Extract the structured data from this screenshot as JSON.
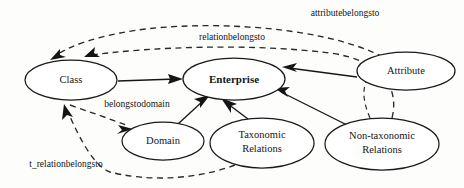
{
  "diagram": {
    "type": "ontology-concept-graph",
    "background_color": "#fdfdfc",
    "stroke_color": "#161616",
    "nodes": [
      {
        "id": "class",
        "label": "Class",
        "label_line1": "Class",
        "label_line2": "",
        "cx": 71,
        "cy": 80,
        "rx": 46,
        "ry": 20,
        "bold": false
      },
      {
        "id": "enterprise",
        "label": "Enterprise",
        "label_line1": "Enterprise",
        "label_line2": "",
        "cx": 234,
        "cy": 79,
        "rx": 51,
        "ry": 21,
        "bold": true
      },
      {
        "id": "attribute",
        "label": "Attribute",
        "label_line1": "Attribute",
        "label_line2": "",
        "cx": 406,
        "cy": 71,
        "rx": 49,
        "ry": 19,
        "bold": false
      },
      {
        "id": "domain",
        "label": "Domain",
        "label_line1": "Domain",
        "label_line2": "",
        "cx": 163,
        "cy": 141,
        "rx": 41,
        "ry": 19,
        "bold": false
      },
      {
        "id": "taxonomic",
        "label": "Taxonomic Relations",
        "label_line1": "Taxonomic",
        "label_line2": "Relations",
        "cx": 262,
        "cy": 143,
        "rx": 52,
        "ry": 25,
        "bold": false
      },
      {
        "id": "nontaxonomic",
        "label": "Non-taxonomic Relations",
        "label_line1": "Non-taxonomic",
        "label_line2": "Relations",
        "cx": 382,
        "cy": 144,
        "rx": 57,
        "ry": 26,
        "bold": false
      }
    ],
    "edge_labels": [
      {
        "id": "attributebelongsto",
        "text": "attributebelongsto",
        "x": 345,
        "y": 14
      },
      {
        "id": "relationbelongsto",
        "text": "relationbelongsto",
        "x": 232,
        "y": 38
      },
      {
        "id": "belongstodomain",
        "text": "belongstodomain",
        "x": 137,
        "y": 105
      },
      {
        "id": "t_relationbelongsto",
        "text": "t_relationbelongsto",
        "x": 66,
        "y": 165
      }
    ],
    "edges": [
      {
        "id": "class-to-enterprise",
        "from": "class",
        "to": "enterprise",
        "style": "solid",
        "label": ""
      },
      {
        "id": "domain-to-enterprise",
        "from": "domain",
        "to": "enterprise",
        "style": "solid",
        "label": ""
      },
      {
        "id": "taxonomic-to-enterprise",
        "from": "taxonomic",
        "to": "enterprise",
        "style": "solid",
        "label": ""
      },
      {
        "id": "nontaxonomic-to-enterprise",
        "from": "nontaxonomic",
        "to": "enterprise",
        "style": "solid",
        "label": ""
      },
      {
        "id": "attribute-to-enterprise",
        "from": "attribute",
        "to": "enterprise",
        "style": "solid",
        "label": ""
      },
      {
        "id": "attribute-to-class",
        "from": "attribute",
        "to": "class",
        "style": "dashed",
        "label": "attributebelongsto"
      },
      {
        "id": "nontaxonomic-to-class",
        "from": "nontaxonomic",
        "to": "class",
        "style": "dashed",
        "label": "relationbelongsto"
      },
      {
        "id": "class-to-domain",
        "from": "class",
        "to": "domain",
        "style": "dashed",
        "label": "belongstodomain"
      },
      {
        "id": "taxonomic-to-class",
        "from": "taxonomic",
        "to": "class",
        "style": "dashed",
        "label": "t_relationbelongsto"
      },
      {
        "id": "nontaxonomic-to-attribute",
        "from": "nontaxonomic",
        "to": "attribute",
        "style": "dashed",
        "label": ""
      }
    ]
  }
}
